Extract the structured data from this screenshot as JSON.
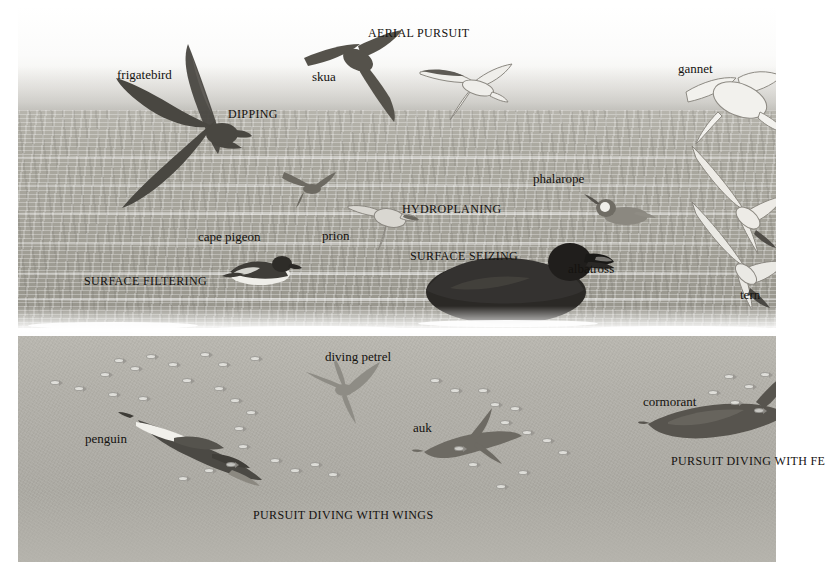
{
  "plate": {
    "title": "Seabird feeding methods",
    "background": "#ffffff",
    "illustration_bounds": {
      "x": 18,
      "y": 6,
      "width": 758,
      "height": 556
    }
  },
  "zones": [
    {
      "name": "sky",
      "label": "sky",
      "top": 0,
      "height": 108,
      "color": "#f4f3f0"
    },
    {
      "name": "sea-surface",
      "label": "sea surface",
      "top": 104,
      "height": 218,
      "color": "#a6a49b"
    },
    {
      "name": "waterline",
      "label": "waterline foam",
      "top": 300,
      "height": 36,
      "color": "#ffffff"
    },
    {
      "name": "underwater",
      "label": "underwater",
      "top": 330,
      "height": 226,
      "color": "#b2b0a9"
    }
  ],
  "species_labels": [
    {
      "id": "frigatebird",
      "text": "frigatebird",
      "x": 117,
      "y": 68
    },
    {
      "id": "skua",
      "text": "skua",
      "x": 312,
      "y": 70
    },
    {
      "id": "gannet",
      "text": "gannet",
      "x": 678,
      "y": 62
    },
    {
      "id": "phalarope",
      "text": "phalarope",
      "x": 533,
      "y": 172
    },
    {
      "id": "cape-pigeon",
      "text": "cape pigeon",
      "x": 198,
      "y": 230
    },
    {
      "id": "prion",
      "text": "prion",
      "x": 322,
      "y": 229
    },
    {
      "id": "albatross",
      "text": "albatross",
      "x": 568,
      "y": 262
    },
    {
      "id": "tern",
      "text": "tern",
      "x": 740,
      "y": 288
    },
    {
      "id": "diving-petrel",
      "text": "diving petrel",
      "x": 325,
      "y": 350
    },
    {
      "id": "penguin",
      "text": "penguin",
      "x": 85,
      "y": 432
    },
    {
      "id": "auk",
      "text": "auk",
      "x": 413,
      "y": 421
    },
    {
      "id": "cormorant",
      "text": "cormorant",
      "x": 643,
      "y": 395
    }
  ],
  "method_labels": [
    {
      "id": "aerial-pursuit",
      "text": "AERIAL PURSUIT",
      "x": 368,
      "y": 27
    },
    {
      "id": "dipping",
      "text": "DIPPING",
      "x": 228,
      "y": 108
    },
    {
      "id": "hydroplaning",
      "text": "HYDROPLANING",
      "x": 402,
      "y": 203
    },
    {
      "id": "surface-seizing",
      "text": "SURFACE SEIZING",
      "x": 410,
      "y": 250
    },
    {
      "id": "surface-filtering",
      "text": "SURFACE FILTERING",
      "x": 84,
      "y": 275
    },
    {
      "id": "pursuit-diving-wings",
      "text": "PURSUIT DIVING WITH WINGS",
      "x": 253,
      "y": 509
    },
    {
      "id": "pursuit-diving-feet",
      "text": "PURSUIT DIVING WITH FE",
      "x": 671,
      "y": 455,
      "truncated": true
    }
  ],
  "birds": [
    {
      "id": "frigatebird",
      "kind": "flying-dark",
      "x": 92,
      "y": 30,
      "w": 175,
      "h": 170,
      "tone": "#4a4843"
    },
    {
      "id": "storm-petrel-small",
      "kind": "flying-small-dark",
      "x": 258,
      "y": 160,
      "w": 60,
      "h": 40,
      "tone": "#6a675f"
    },
    {
      "id": "skua",
      "kind": "flying-dark",
      "x": 282,
      "y": 24,
      "w": 110,
      "h": 100,
      "tone": "#56534c"
    },
    {
      "id": "tern-aerial",
      "kind": "flying-pale",
      "x": 402,
      "y": 56,
      "w": 95,
      "h": 70,
      "tone": "#e8e7e2"
    },
    {
      "id": "gannet-upper",
      "kind": "flying-pale",
      "x": 660,
      "y": 56,
      "w": 116,
      "h": 110,
      "tone": "#f0efeb"
    },
    {
      "id": "gannet-plunging",
      "kind": "diving-pale",
      "x": 672,
      "y": 140,
      "w": 104,
      "h": 110,
      "tone": "#eceae5"
    },
    {
      "id": "tern-plunging",
      "kind": "diving-pale",
      "x": 676,
      "y": 196,
      "w": 100,
      "h": 110,
      "tone": "#e9e8e3"
    },
    {
      "id": "prion",
      "kind": "hydroplaning",
      "x": 330,
      "y": 195,
      "w": 70,
      "h": 50,
      "tone": "#d6d4ce"
    },
    {
      "id": "cape-pigeon",
      "kind": "swimming",
      "x": 200,
      "y": 248,
      "w": 82,
      "h": 34,
      "tone": "#3e3c37"
    },
    {
      "id": "phalarope",
      "kind": "swimming",
      "x": 570,
      "y": 188,
      "w": 64,
      "h": 32,
      "tone": "#6e6b63"
    },
    {
      "id": "albatross",
      "kind": "swimming-large",
      "x": 408,
      "y": 228,
      "w": 180,
      "h": 96,
      "tone": "#2b2926"
    },
    {
      "id": "diving-petrel",
      "kind": "underwater",
      "x": 288,
      "y": 352,
      "w": 74,
      "h": 62,
      "tone": "#8d8b84"
    },
    {
      "id": "penguin",
      "kind": "underwater-large",
      "x": 104,
      "y": 398,
      "w": 140,
      "h": 92,
      "tone": "#4b4944"
    },
    {
      "id": "auk",
      "kind": "underwater",
      "x": 400,
      "y": 402,
      "w": 96,
      "h": 60,
      "tone": "#6d6a63"
    },
    {
      "id": "cormorant",
      "kind": "underwater-large",
      "x": 626,
      "y": 368,
      "w": 150,
      "h": 78,
      "tone": "#57544e"
    }
  ],
  "fish_schools": [
    {
      "id": "school-penguin",
      "count": 24,
      "x": 48,
      "y": 362,
      "w": 230,
      "h": 120
    },
    {
      "id": "school-auk",
      "count": 14,
      "x": 418,
      "y": 368,
      "w": 150,
      "h": 140
    },
    {
      "id": "school-cormorant",
      "count": 6,
      "x": 700,
      "y": 372,
      "w": 70,
      "h": 60
    }
  ]
}
